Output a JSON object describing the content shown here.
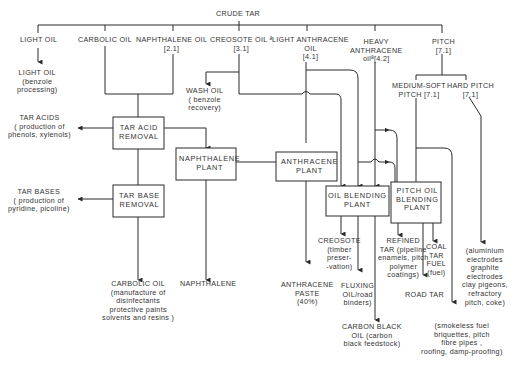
{
  "diagram": {
    "title": "CRUDE TAR",
    "fractions": {
      "light_oil": "LIGHT OIL",
      "carbolic_oil": "CARBOLIC OIL",
      "naphthalene_oil": "NAPHTHALENE OIL\n[2.1]",
      "creosote_oil": "CREOSOTE OIL ª\n[3.1]",
      "light_anthracene_oil": "LIGHT ANTHRACENE\nOIL\n[4.1]",
      "heavy_anthracene_oil": "HEAVY\nANTHRACENE\noilª[4.2]",
      "pitch": "PITCH\n[7.1]"
    },
    "pitch_grades": {
      "medium_soft": "MEDIUM-SOFT\nPITCH [7.1]",
      "hard": "HARD PITCH\n[7.1]"
    },
    "processes": {
      "tar_acid_removal": "TAR ACID\nREMOVAL",
      "tar_base_removal": "TAR BASE\nREMOVAL",
      "naphthalene_plant": "NAPHTHALENE\nPLANT",
      "anthracene_plant": "ANTHRACENE\nPLANT",
      "oil_blending_plant": "OIL BLENDING\nPLANT",
      "pitch_oil_blending_plant": "PITCH OIL\nBLENDING\nPLANT"
    },
    "products": {
      "light_oil_product": "LIGHT OIL\n(benzole\nprocessing)",
      "wash_oil": "WASH OIL\n( benzole\nrecovery)",
      "tar_acids": "TAR ACIDS\n( production of\nphenols, xylenols)",
      "tar_bases": "TAR BASES\n( production of\npyridine, picoline)",
      "carbolic_oil_product": "CARBOLIC OIL\n(manufacture of\ndisinfectants\nprotective paints\nsolvents and resins )",
      "naphthalene": "NAPHTHALENE",
      "anthracene_paste": "ANTHRACENE\nPASTE\n(40%)",
      "creosote": "CREOSOTE\n(timber\npreser-\n-vation)",
      "fluxing_oil": "FLUXING\nOIL/road\nbinders)",
      "carbon_black_oil": "CARBON BLACK\nOIL (carbon\nblack feedstock)",
      "refined_tar": "REFINED\nTAR (pipeline\nenamels, pitch\npolymer\ncoatings)",
      "coal_tar_fuel": "COAL\nTAR\nFUEL\n(fuel)",
      "road_tar": "ROAD TAR",
      "medium_soft_uses": "(smokeless fuel\nbriquettes, pitch\nfibre pipes ,\nroofing, damp-proofing)",
      "hard_pitch_uses": "(aluminium\nelectrodes\ngraphite\nelectrodes\nclay pigeons,\nrefractory\npitch, coke)"
    },
    "colors": {
      "line": "#2a2a2a",
      "text": "#333333",
      "background": "#ffffff"
    }
  }
}
